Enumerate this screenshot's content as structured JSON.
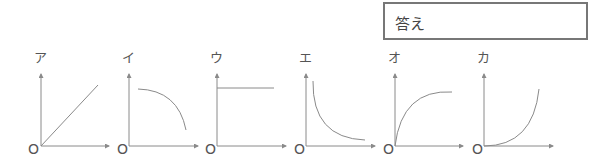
{
  "answer_box": {
    "label": "答え"
  },
  "graphs": [
    {
      "label": "ア",
      "origin": "O",
      "shape": "linear-increasing"
    },
    {
      "label": "イ",
      "origin": "O",
      "shape": "concave-down-decreasing"
    },
    {
      "label": "ウ",
      "origin": "O",
      "shape": "constant"
    },
    {
      "label": "エ",
      "origin": "O",
      "shape": "inverse-decreasing"
    },
    {
      "label": "オ",
      "origin": "O",
      "shape": "saturating-increasing"
    },
    {
      "label": "カ",
      "origin": "O",
      "shape": "exponential-increasing"
    }
  ],
  "colors": {
    "axis": "#8a8a8a",
    "curve": "#8a8a8a",
    "border": "#777777"
  }
}
